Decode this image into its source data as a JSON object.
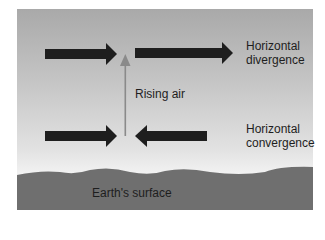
{
  "diagram": {
    "labels": {
      "divergence": [
        "Horizontal",
        "divergence"
      ],
      "convergence": [
        "Horizontal",
        "convergence"
      ],
      "rising_air": "Rising air",
      "surface": "Earth's surface"
    },
    "colors": {
      "sky_top": "#a9a9a9",
      "sky_bottom": "#f4f4f4",
      "ground": "#6f6f6f",
      "arrow": "#1e1e1e",
      "rising_arrow": "#8a8a8a"
    }
  }
}
